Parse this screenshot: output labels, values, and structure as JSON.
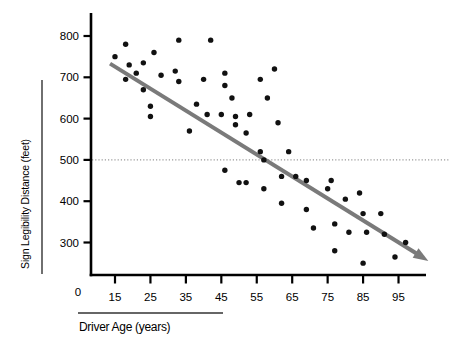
{
  "chart_data": {
    "type": "scatter",
    "title": "",
    "xlabel": "Driver Age (years)",
    "ylabel": "Sign Legibility Distance (feet)",
    "origin_label": "0",
    "x_ticks": [
      15,
      25,
      35,
      45,
      55,
      65,
      75,
      85,
      95
    ],
    "y_ticks": [
      300,
      400,
      500,
      600,
      700,
      800
    ],
    "xlim": [
      8,
      104
    ],
    "ylim": [
      215,
      855
    ],
    "grid": false,
    "legend": "none",
    "colors": {
      "point": "#111111",
      "axis": "#000000",
      "trend_line": "#7a7a7a",
      "reference_line": "#999999",
      "label_rule": "#333333"
    },
    "reference_line": {
      "y": 500,
      "style": "dotted"
    },
    "trend_line": {
      "x1": 13.6,
      "y1": 733,
      "x2": 100.3,
      "y2": 272,
      "arrow_at_end": true
    },
    "points": [
      [
        15,
        750
      ],
      [
        18,
        780
      ],
      [
        18,
        695
      ],
      [
        19,
        730
      ],
      [
        21,
        710
      ],
      [
        23,
        735
      ],
      [
        23,
        670
      ],
      [
        25,
        630
      ],
      [
        25,
        605
      ],
      [
        26,
        760
      ],
      [
        28,
        705
      ],
      [
        32,
        715
      ],
      [
        33,
        790
      ],
      [
        33,
        690
      ],
      [
        36,
        570
      ],
      [
        38,
        635
      ],
      [
        40,
        695
      ],
      [
        41,
        610
      ],
      [
        42,
        790
      ],
      [
        45,
        610
      ],
      [
        46,
        710
      ],
      [
        46,
        680
      ],
      [
        46,
        475
      ],
      [
        48,
        650
      ],
      [
        49,
        605
      ],
      [
        49,
        585
      ],
      [
        50,
        445
      ],
      [
        52,
        565
      ],
      [
        52,
        445
      ],
      [
        53,
        610
      ],
      [
        56,
        695
      ],
      [
        56,
        520
      ],
      [
        57,
        500
      ],
      [
        57,
        430
      ],
      [
        58,
        650
      ],
      [
        60,
        720
      ],
      [
        61,
        590
      ],
      [
        62,
        460
      ],
      [
        62,
        395
      ],
      [
        64,
        520
      ],
      [
        66,
        460
      ],
      [
        69,
        450
      ],
      [
        69,
        380
      ],
      [
        71,
        335
      ],
      [
        75,
        430
      ],
      [
        76,
        450
      ],
      [
        77,
        345
      ],
      [
        77,
        280
      ],
      [
        80,
        405
      ],
      [
        81,
        325
      ],
      [
        84,
        420
      ],
      [
        85,
        370
      ],
      [
        85,
        250
      ],
      [
        86,
        325
      ],
      [
        90,
        370
      ],
      [
        91,
        320
      ],
      [
        94,
        265
      ],
      [
        97,
        300
      ]
    ]
  }
}
